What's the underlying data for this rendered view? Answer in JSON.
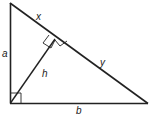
{
  "diagram": {
    "type": "right-triangle-altitude",
    "colors": {
      "stroke": "#222222",
      "background": "#ffffff"
    },
    "vertices": {
      "top": [
        10,
        3
      ],
      "right_angle": [
        10,
        103
      ],
      "bottom_right": [
        148,
        103
      ],
      "altitude_foot": [
        55,
        40
      ]
    },
    "labels": {
      "x": "x",
      "y": "y",
      "a": "a",
      "b": "b",
      "h": "h"
    }
  }
}
